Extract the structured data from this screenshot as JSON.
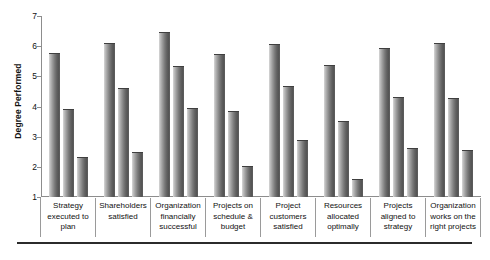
{
  "chart_data": {
    "type": "bar",
    "title": "",
    "subtitle": "",
    "xlabel": "",
    "ylabel": "Degree Performed",
    "ylim": [
      1,
      7
    ],
    "yticks": [
      1,
      2,
      3,
      4,
      5,
      6,
      7
    ],
    "grid": false,
    "legend": null,
    "orientation": "vertical",
    "grouping": "grouped",
    "categories": [
      "Strategy executed to plan",
      "Shareholders satisfied",
      "Organization financially successful",
      "Projects on schedule & budget",
      "Project customers satisfied",
      "Resources allocated optimally",
      "Projects aligned to strategy",
      "Organization works on the right projects"
    ],
    "category_lines": [
      [
        "Strategy",
        "executed to",
        "plan"
      ],
      [
        "Shareholders",
        "satisfied"
      ],
      [
        "Organization",
        "financially",
        "successful"
      ],
      [
        "Projects on",
        "schedule &",
        "budget"
      ],
      [
        "Project",
        "customers",
        "satisfied"
      ],
      [
        "Resources",
        "allocated",
        "optimally"
      ],
      [
        "Projects",
        "aligned to",
        "strategy"
      ],
      [
        "Organization",
        "works on the",
        "right projects"
      ]
    ],
    "series": [
      {
        "name": "Series 1",
        "values": [
          5.75,
          6.08,
          6.45,
          5.72,
          6.05,
          5.33,
          5.92,
          6.08
        ]
      },
      {
        "name": "Series 2",
        "values": [
          3.9,
          4.58,
          5.3,
          3.82,
          4.65,
          3.48,
          4.27,
          4.24
        ]
      },
      {
        "name": "Series 3",
        "values": [
          2.3,
          2.47,
          3.92,
          2.0,
          2.87,
          1.58,
          2.58,
          2.54
        ]
      }
    ]
  },
  "axis": {
    "y_title": "Degree Performed",
    "tick_labels": [
      "7",
      "6",
      "5",
      "4",
      "3",
      "2",
      "1"
    ]
  }
}
